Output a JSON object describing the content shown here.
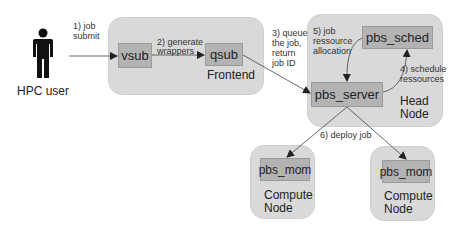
{
  "actor": {
    "label": "HPC user",
    "icon": "person-icon"
  },
  "groups": {
    "frontend": {
      "label": "Frontend"
    },
    "head_node": {
      "label_line1": "Head",
      "label_line2": "Node"
    },
    "compute_left": {
      "label_line1": "Compute",
      "label_line2": "Node"
    },
    "compute_right": {
      "label_line1": "Compute",
      "label_line2": "Node"
    }
  },
  "components": {
    "vsub": "vsub",
    "qsub": "qsub",
    "pbs_sched": "pbs_sched",
    "pbs_server": "pbs_server",
    "pbs_mom_left": "pbs_mom",
    "pbs_mom_right": "pbs_mom"
  },
  "steps": {
    "s1": {
      "line1": "1) job",
      "line2": "submit"
    },
    "s2": {
      "line1": "2) generate",
      "line2": "wrappers"
    },
    "s3": {
      "line1": "3) queue",
      "line2": "the job,",
      "line3": "return",
      "line4": "job ID"
    },
    "s4": {
      "line1": "4) schedule",
      "line2": "ressources"
    },
    "s5": {
      "line1": "5) job",
      "line2": "ressource",
      "line3": "allocation"
    },
    "s6": {
      "line1": "6) deploy job"
    }
  },
  "colors": {
    "group_fill": "#d9d9d9",
    "box_fill": "#b3b3b3",
    "box_border": "#9a9a9a",
    "edge": "#333333"
  }
}
